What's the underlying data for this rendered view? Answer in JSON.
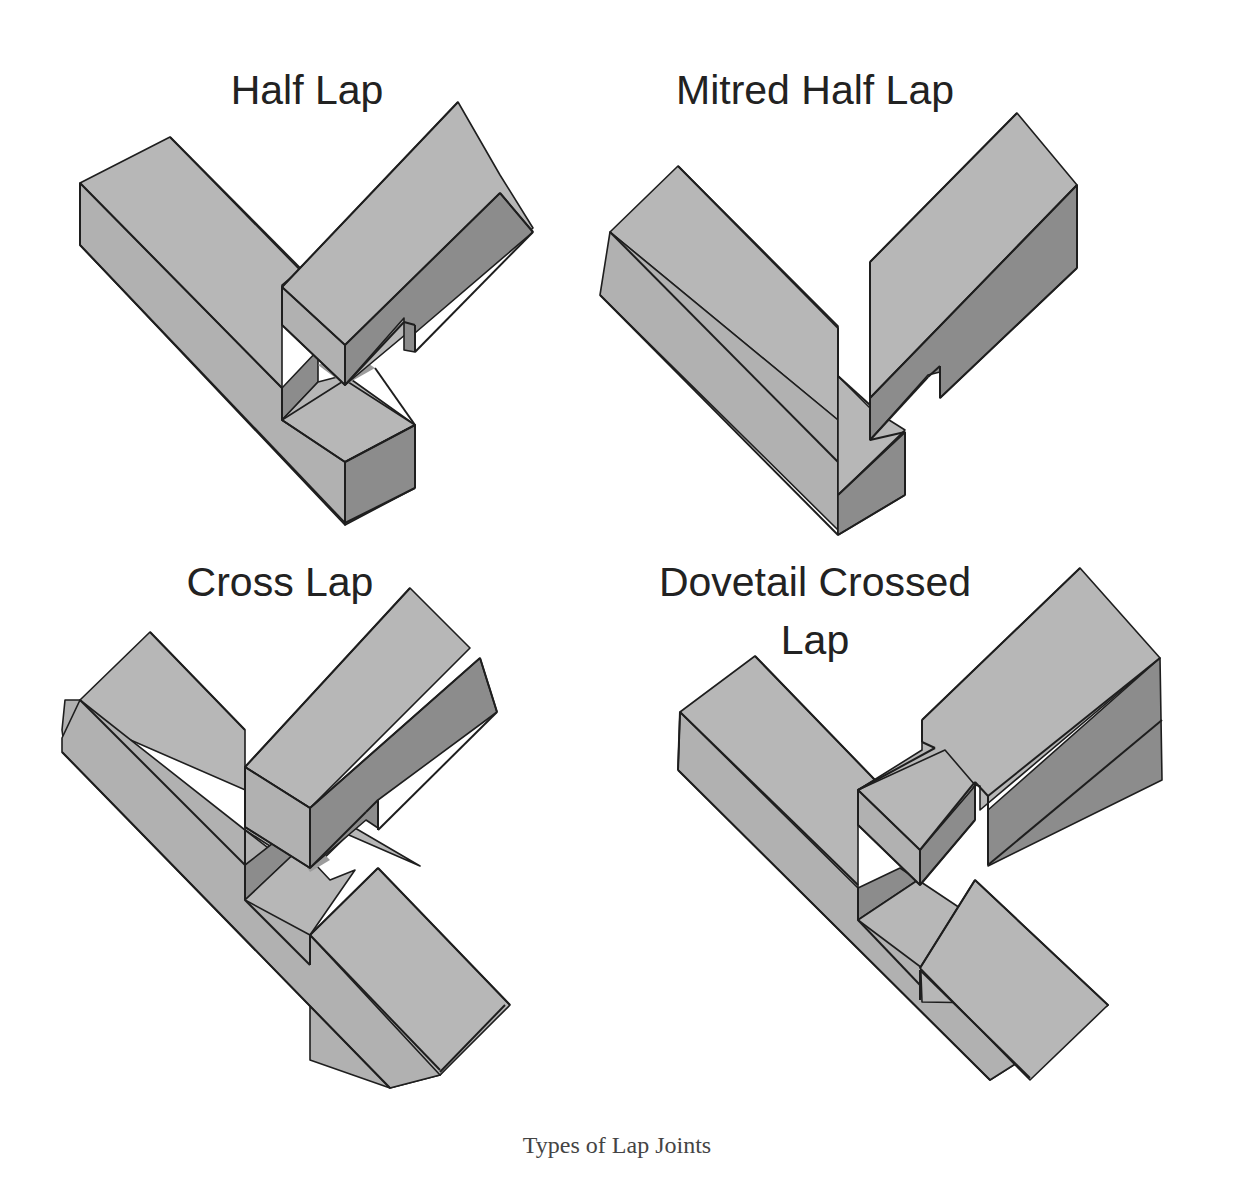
{
  "figure": {
    "caption": "Types of Lap Joints",
    "panels": [
      {
        "id": "half-lap",
        "title": "Half Lap"
      },
      {
        "id": "mitred-half-lap",
        "title": "Mitred Half Lap"
      },
      {
        "id": "cross-lap",
        "title": "Cross Lap"
      },
      {
        "id": "dovetail-crossed-lap",
        "title_line1": "Dovetail Crossed",
        "title_line2": "Lap"
      }
    ],
    "colors": {
      "wood_top": "#b7b7b7",
      "wood_side": "#b1b1b1",
      "wood_shadow": "#8c8c8c",
      "edge": "#1e1e1e",
      "background": "#ffffff"
    }
  }
}
